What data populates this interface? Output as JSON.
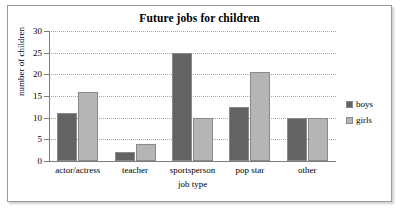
{
  "frame": {
    "border_color": "#9a9a9a"
  },
  "legend": {
    "position": "right",
    "entries": [
      {
        "label": "boys",
        "color": "#636363"
      },
      {
        "label": "girls",
        "color": "#b5b5b5"
      }
    ]
  },
  "chart_data": {
    "type": "bar",
    "title": "Future jobs for children",
    "xlabel": "job type",
    "ylabel": "number of children",
    "categories": [
      "actor/actress",
      "teacher",
      "sportsperson",
      "pop star",
      "other"
    ],
    "series": [
      {
        "name": "boys",
        "color": "#636363",
        "values": [
          11,
          2,
          25,
          12.5,
          10
        ]
      },
      {
        "name": "girls",
        "color": "#b5b5b5",
        "values": [
          16,
          4,
          10,
          20.5,
          10
        ]
      }
    ],
    "ylim": [
      0,
      30
    ],
    "ytick_step": 5,
    "yticks": [
      0,
      5,
      10,
      15,
      20,
      25,
      30
    ],
    "ytick_labels": [
      "0",
      "5",
      "10",
      "15",
      "20",
      "25",
      "30"
    ],
    "grid": true,
    "grid_style": "dotted-horizontal"
  }
}
